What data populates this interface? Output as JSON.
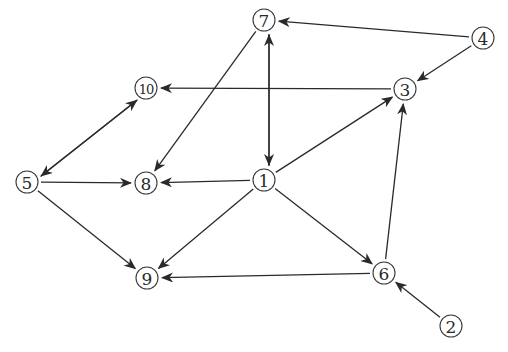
{
  "diagram": {
    "type": "directed-graph",
    "nodes": [
      {
        "id": "1",
        "label": "1",
        "x": 264,
        "y": 180
      },
      {
        "id": "2",
        "label": "2",
        "x": 451,
        "y": 326
      },
      {
        "id": "3",
        "label": "3",
        "x": 405,
        "y": 89
      },
      {
        "id": "4",
        "label": "4",
        "x": 483,
        "y": 38
      },
      {
        "id": "5",
        "label": "5",
        "x": 27,
        "y": 182
      },
      {
        "id": "6",
        "label": "6",
        "x": 384,
        "y": 273
      },
      {
        "id": "7",
        "label": "7",
        "x": 264,
        "y": 20
      },
      {
        "id": "8",
        "label": "8",
        "x": 146,
        "y": 183
      },
      {
        "id": "9",
        "label": "9",
        "x": 147,
        "y": 278
      },
      {
        "id": "10",
        "label": "10",
        "x": 146,
        "y": 88
      }
    ],
    "edges": [
      {
        "from": "4",
        "to": "7"
      },
      {
        "from": "4",
        "to": "3"
      },
      {
        "from": "3",
        "to": "10"
      },
      {
        "from": "7",
        "to": "8"
      },
      {
        "from": "7",
        "to": "1",
        "offset": -5
      },
      {
        "from": "1",
        "to": "7",
        "offset": 5
      },
      {
        "from": "10",
        "to": "5",
        "offset": -4
      },
      {
        "from": "5",
        "to": "10",
        "offset": 4
      },
      {
        "from": "5",
        "to": "8"
      },
      {
        "from": "1",
        "to": "8"
      },
      {
        "from": "1",
        "to": "3"
      },
      {
        "from": "5",
        "to": "9"
      },
      {
        "from": "1",
        "to": "9"
      },
      {
        "from": "1",
        "to": "6"
      },
      {
        "from": "6",
        "to": "9"
      },
      {
        "from": "6",
        "to": "3"
      },
      {
        "from": "2",
        "to": "6"
      }
    ]
  },
  "style": {
    "edge_color": "#2a2a2a",
    "node_stroke": "#3a3a3a",
    "background": "#ffffff",
    "node_radius": 11
  }
}
